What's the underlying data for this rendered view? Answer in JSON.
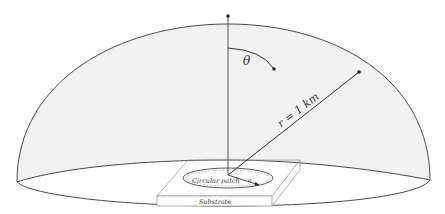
{
  "diagram": {
    "type": "hemisphere radiation geometry",
    "labels": {
      "theta": "θ",
      "radius": "r = 1 km",
      "patch": "Circular patch",
      "patch_radius": "a",
      "substrate": "Substrate"
    },
    "colors": {
      "dome_fill": "#f2f2f2",
      "outline": "#4a4a4a",
      "light_line": "#9a9a9a",
      "background": "#ffffff"
    }
  }
}
